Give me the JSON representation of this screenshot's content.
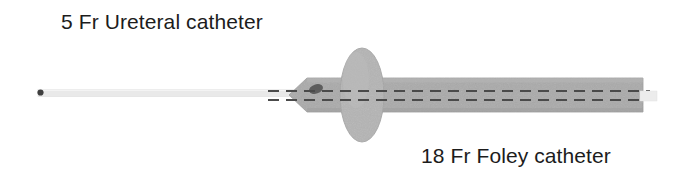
{
  "figure": {
    "background_color": "#ffffff",
    "width": 676,
    "height": 175
  },
  "labels": {
    "ureteral": "5 Fr Ureteral catheter",
    "foley": "18 Fr Foley catheter"
  },
  "colors": {
    "text": "#1c1c1c",
    "foley_shaft": "#aaaaaa",
    "foley_shaft_edge": "#9a9a9a",
    "balloon": "#b4b4b4",
    "balloon_edge": "#a2a2a2",
    "ureteral_catheter": "#e9e9e9",
    "ureteral_catheter_edge": "#dcdcdc",
    "lumen_dash": "#4a4a4a",
    "eyelet": "#5a5a5a",
    "tip_marker": "#3f3f3f"
  },
  "diagram": {
    "ureteral_catheter": {
      "name": "5 Fr Ureteral catheter",
      "x_start": 38,
      "x_end": 300,
      "y_center": 93,
      "thickness": 7,
      "tip_dot": {
        "cx": 40,
        "cy": 92,
        "rx": 3,
        "ry": 3
      },
      "distal_exit": {
        "x_start": 640,
        "x_end": 657,
        "y_center": 96,
        "thickness": 9
      }
    },
    "foley_catheter": {
      "name": "18 Fr Foley catheter",
      "tip_apex_x": 289,
      "tip_taper_end_x": 322,
      "shaft_x_start": 322,
      "shaft_x_end": 643,
      "shaft_y_top": 78,
      "shaft_y_bottom": 112,
      "drainage_eyelet": {
        "cx": 316,
        "cy": 89,
        "rx": 7,
        "ry": 4.5,
        "rotation": -18
      },
      "lumen_lines": [
        {
          "y": 91,
          "x_start": 268,
          "x_end": 648
        },
        {
          "y": 100,
          "x_start": 268,
          "x_end": 648
        }
      ],
      "dash_pattern": "11 7"
    },
    "retention_balloon": {
      "name": "retention balloon",
      "cx": 362,
      "cy": 95,
      "rx": 22,
      "ry": 47
    }
  }
}
